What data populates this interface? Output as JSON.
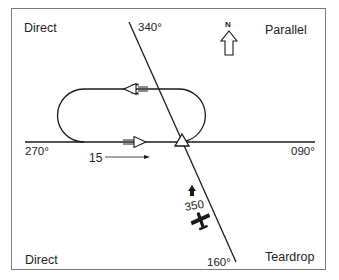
{
  "diagram": {
    "corners": {
      "top_left": "Direct",
      "top_right": "Parallel",
      "bottom_left": "Direct",
      "bottom_right": "Teardrop"
    },
    "bearings": {
      "top": "340°",
      "bottom": "160°",
      "left": "270°",
      "right": "090°"
    },
    "north_label": "N",
    "leg_label": "15",
    "heading_label": "350",
    "colors": {
      "line": "#1a1a1a",
      "frame": "#7a7a7a",
      "text": "#222222",
      "background": "#ffffff"
    }
  }
}
